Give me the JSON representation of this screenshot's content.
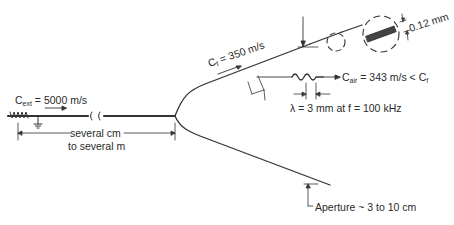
{
  "diagram": {
    "fiber_speed": {
      "symbol": "C",
      "sub": "f",
      "eq": "= 350 m/s"
    },
    "ext_speed": {
      "symbol": "C",
      "sub": "ext",
      "eq": "= 5000 m/s"
    },
    "air_speed": {
      "symbol": "C",
      "sub": "air",
      "eq": "= 343 m/s < C",
      "tail_sub": "f"
    },
    "wavelength": "λ = 3 mm at f = 100 kHz",
    "thickness": "0.12 mm",
    "length_line1": "several cm",
    "length_line2": "to several m",
    "aperture": "Aperture ~ 3 to 10 cm",
    "colors": {
      "line": "#333333",
      "text": "#2a2a2a",
      "background": "#ffffff"
    }
  }
}
